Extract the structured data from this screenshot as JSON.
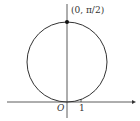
{
  "diagram": {
    "type": "polar-circle",
    "point_label": "(0, π/2)",
    "origin_label": "O",
    "tick_label": "1",
    "colors": {
      "stroke": "#333333",
      "background": "#ffffff"
    }
  }
}
